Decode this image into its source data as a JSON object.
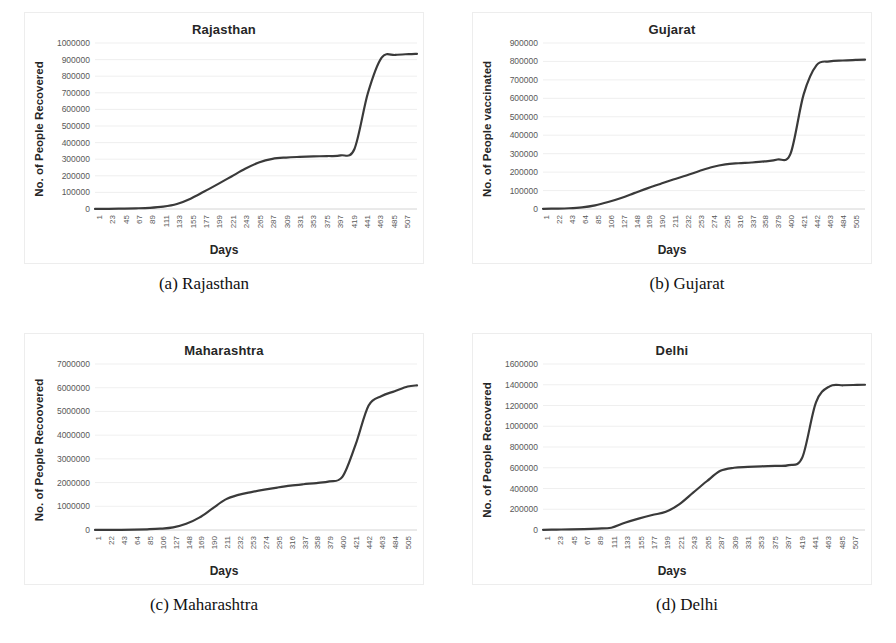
{
  "figure": {
    "caption_font": "serif",
    "line_color": "#3a3a3a",
    "grid_color": "#e8e8e8"
  },
  "panels": [
    {
      "key": "rajasthan",
      "caption": "(a) Rajasthan",
      "chart_data": {
        "type": "line",
        "title": "Rajasthan",
        "xlabel": "Days",
        "ylabel": "No. of People Recovered",
        "ylim": [
          0,
          1000000
        ],
        "ytick_labels": [
          "0",
          "100000",
          "200000",
          "300000",
          "400000",
          "500000",
          "600000",
          "700000",
          "800000",
          "900000",
          "1000000"
        ],
        "ytick_values": [
          0,
          100000,
          200000,
          300000,
          400000,
          500000,
          600000,
          700000,
          800000,
          900000,
          1000000
        ],
        "xtick_labels": [
          "1",
          "23",
          "45",
          "67",
          "89",
          "111",
          "133",
          "155",
          "177",
          "199",
          "221",
          "243",
          "265",
          "287",
          "309",
          "331",
          "353",
          "375",
          "397",
          "419",
          "441",
          "463",
          "485",
          "507"
        ],
        "xlim": [
          1,
          520
        ],
        "grid": true,
        "legend": "none",
        "x": [
          1,
          23,
          45,
          67,
          89,
          111,
          133,
          155,
          177,
          199,
          221,
          243,
          265,
          287,
          309,
          331,
          353,
          375,
          397,
          419,
          441,
          463,
          485,
          507,
          520
        ],
        "y": [
          500,
          1200,
          2600,
          4200,
          7000,
          14000,
          30000,
          62000,
          105000,
          150000,
          196000,
          242000,
          280000,
          302000,
          310000,
          314000,
          317000,
          319000,
          323000,
          360000,
          700000,
          912000,
          928000,
          933000,
          935000
        ]
      }
    },
    {
      "key": "gujarat",
      "caption": "(b) Gujarat",
      "chart_data": {
        "type": "line",
        "title": "Gujarat",
        "xlabel": "Days",
        "ylabel": "No. of People vaccinated",
        "ylim": [
          0,
          900000
        ],
        "ytick_labels": [
          "0",
          "100000",
          "200000",
          "300000",
          "400000",
          "500000",
          "600000",
          "700000",
          "800000",
          "900000"
        ],
        "ytick_values": [
          0,
          100000,
          200000,
          300000,
          400000,
          500000,
          600000,
          700000,
          800000,
          900000
        ],
        "xtick_labels": [
          "1",
          "22",
          "43",
          "64",
          "85",
          "106",
          "127",
          "148",
          "169",
          "190",
          "211",
          "232",
          "253",
          "274",
          "295",
          "316",
          "337",
          "358",
          "379",
          "400",
          "421",
          "442",
          "463",
          "484",
          "505"
        ],
        "xlim": [
          1,
          520
        ],
        "grid": true,
        "legend": "none",
        "x": [
          1,
          22,
          43,
          64,
          85,
          106,
          127,
          148,
          169,
          190,
          211,
          232,
          253,
          274,
          295,
          316,
          337,
          358,
          379,
          400,
          421,
          442,
          463,
          484,
          505,
          520
        ],
        "y": [
          1000,
          2000,
          4000,
          9000,
          20000,
          38000,
          60000,
          86000,
          112000,
          136000,
          160000,
          182000,
          206000,
          228000,
          242000,
          248000,
          252000,
          258000,
          268000,
          300000,
          620000,
          780000,
          800000,
          805000,
          808000,
          810000
        ]
      }
    },
    {
      "key": "maharashtra",
      "caption": "(c) Maharashtra",
      "chart_data": {
        "type": "line",
        "title": "Maharashtra",
        "xlabel": "Days",
        "ylabel": "No. of People Recoovered",
        "ylim": [
          0,
          7000000
        ],
        "ytick_labels": [
          "0",
          "1000000",
          "2000000",
          "3000000",
          "4000000",
          "5000000",
          "6000000",
          "7000000"
        ],
        "ytick_values": [
          0,
          1000000,
          2000000,
          3000000,
          4000000,
          5000000,
          6000000,
          7000000
        ],
        "xtick_labels": [
          "1",
          "22",
          "43",
          "64",
          "85",
          "106",
          "127",
          "148",
          "169",
          "190",
          "211",
          "232",
          "253",
          "274",
          "295",
          "316",
          "337",
          "358",
          "379",
          "400",
          "421",
          "442",
          "463",
          "484",
          "505"
        ],
        "xlim": [
          1,
          520
        ],
        "grid": true,
        "legend": "none",
        "x": [
          1,
          22,
          43,
          64,
          85,
          106,
          127,
          148,
          169,
          190,
          211,
          232,
          253,
          274,
          295,
          316,
          337,
          358,
          379,
          400,
          421,
          442,
          463,
          484,
          505,
          520
        ],
        "y": [
          2000,
          4000,
          8000,
          16000,
          30000,
          55000,
          110000,
          260000,
          520000,
          900000,
          1280000,
          1480000,
          1600000,
          1700000,
          1790000,
          1870000,
          1930000,
          1980000,
          2050000,
          2250000,
          3600000,
          5250000,
          5650000,
          5850000,
          6050000,
          6100000
        ]
      }
    },
    {
      "key": "delhi",
      "caption": "(d) Delhi",
      "chart_data": {
        "type": "line",
        "title": "Delhi",
        "xlabel": "Days",
        "ylabel": "No. of People Recovered",
        "ylim": [
          0,
          1600000
        ],
        "ytick_labels": [
          "0",
          "200000",
          "400000",
          "600000",
          "800000",
          "1000000",
          "1200000",
          "1400000",
          "1600000"
        ],
        "ytick_values": [
          0,
          200000,
          400000,
          600000,
          800000,
          1000000,
          1200000,
          1400000,
          1600000
        ],
        "xtick_labels": [
          "1",
          "23",
          "45",
          "67",
          "89",
          "111",
          "133",
          "155",
          "177",
          "199",
          "221",
          "243",
          "265",
          "287",
          "309",
          "331",
          "353",
          "375",
          "397",
          "419",
          "441",
          "463",
          "485",
          "507"
        ],
        "xlim": [
          1,
          520
        ],
        "grid": true,
        "legend": "none",
        "x": [
          1,
          23,
          45,
          67,
          89,
          111,
          133,
          155,
          177,
          199,
          221,
          243,
          265,
          287,
          309,
          331,
          353,
          375,
          397,
          419,
          441,
          463,
          485,
          507,
          520
        ],
        "y": [
          2000,
          4000,
          6000,
          9000,
          14000,
          22000,
          70000,
          110000,
          145000,
          175000,
          250000,
          360000,
          470000,
          570000,
          600000,
          608000,
          614000,
          618000,
          625000,
          700000,
          1230000,
          1385000,
          1395000,
          1398000,
          1400000
        ]
      }
    }
  ]
}
